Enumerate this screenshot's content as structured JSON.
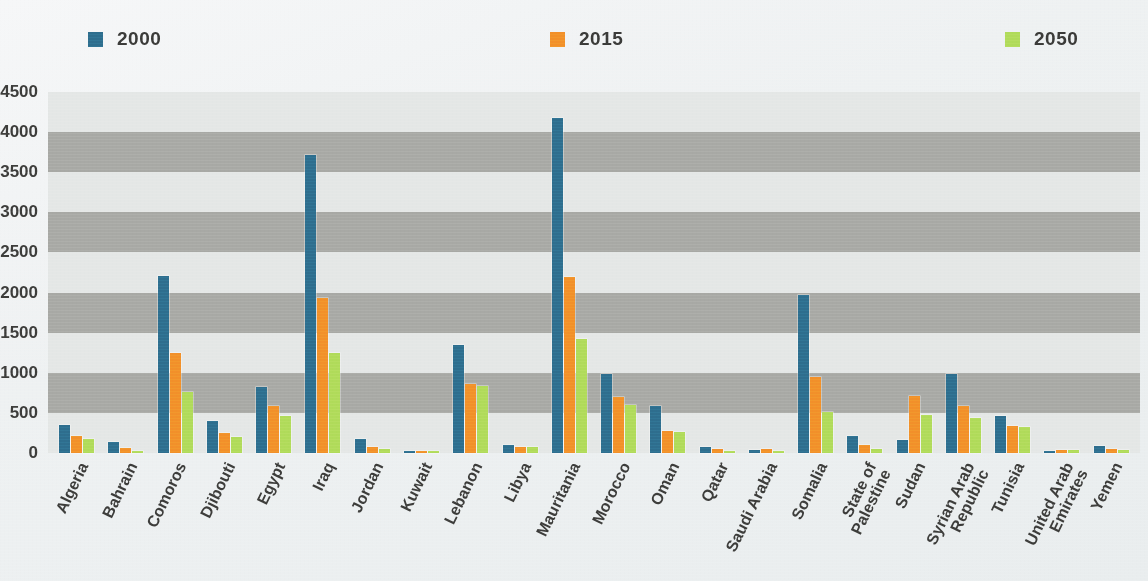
{
  "chart_data": {
    "type": "bar",
    "title": "",
    "subtitle": "",
    "xlabel": "",
    "ylabel": "",
    "ylim": [
      0,
      4500
    ],
    "yticks": [
      0,
      500,
      1000,
      1500,
      2000,
      2500,
      3000,
      3500,
      4000,
      4500
    ],
    "ytick_labels": [
      "0",
      "500",
      "1000",
      "1500",
      "2000",
      "2500",
      "3000",
      "3500",
      "4000",
      "4500"
    ],
    "grid": "horizontal-bands",
    "legend_position": "top",
    "categories": [
      "Algeria",
      "Bahrain",
      "Comoros",
      "Djibouti",
      "Egypt",
      "Iraq",
      "Jordan",
      "Kuwait",
      "Lebanon",
      "Libya",
      "Mauritania",
      "Morocco",
      "Oman",
      "Qatar",
      "Saudi Arabia",
      "Somalia",
      "State of Palestine",
      "Sudan",
      "Syrian Arab Republic",
      "Tunisia",
      "United Arab Emirates",
      "Yemen"
    ],
    "category_label_lines": [
      [
        "Algeria"
      ],
      [
        "Bahrain"
      ],
      [
        "Comoros"
      ],
      [
        "Djibouti"
      ],
      [
        "Egypt"
      ],
      [
        "Iraq"
      ],
      [
        "Jordan"
      ],
      [
        "Kuwait"
      ],
      [
        "Lebanon"
      ],
      [
        "Libya"
      ],
      [
        "Mauritania"
      ],
      [
        "Morocco"
      ],
      [
        "Oman"
      ],
      [
        "Qatar"
      ],
      [
        "Saudi Arabia"
      ],
      [
        "Somalia"
      ],
      [
        "State of",
        "Palestine"
      ],
      [
        "Sudan"
      ],
      [
        "Syrian Arab",
        "Republic"
      ],
      [
        "Tunisia"
      ],
      [
        "United Arab",
        "Emirates"
      ],
      [
        "Yemen"
      ]
    ],
    "series": [
      {
        "name": "2000",
        "color": "#2e6e8e",
        "values": [
          345,
          140,
          2210,
          400,
          820,
          3720,
          180,
          30,
          1350,
          105,
          4170,
          980,
          590,
          75,
          40,
          1970,
          215,
          160,
          990,
          460,
          30,
          90
        ]
      },
      {
        "name": "2015",
        "color": "#f2902a",
        "values": [
          215,
          60,
          1250,
          255,
          590,
          1930,
          70,
          30,
          860,
          80,
          2200,
          700,
          270,
          45,
          55,
          950,
          95,
          710,
          580,
          340,
          35,
          55
        ]
      },
      {
        "name": "2050",
        "color": "#b0db5a",
        "values": [
          175,
          25,
          760,
          205,
          460,
          1250,
          55,
          30,
          830,
          75,
          1420,
          600,
          265,
          30,
          30,
          510,
          50,
          480,
          440,
          320,
          35,
          40
        ]
      }
    ]
  },
  "legend": {
    "items": [
      {
        "label": "2000",
        "color": "#2e6e8e"
      },
      {
        "label": "2015",
        "color": "#f2902a"
      },
      {
        "label": "2050",
        "color": "#b0db5a"
      }
    ]
  }
}
